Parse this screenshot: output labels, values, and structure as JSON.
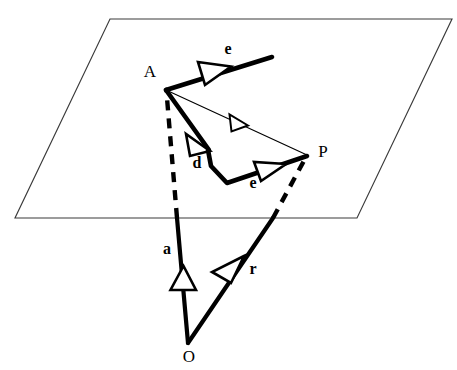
{
  "figure": {
    "background_color": "#ffffff",
    "stroke_color": "#000000",
    "plane_stroke_color": "#3a3a3a",
    "width": 457,
    "height": 370
  },
  "plane": {
    "name": "plane",
    "shape": "parallelogram",
    "corners": [
      {
        "label": "top-left",
        "x": 110,
        "y": 19
      },
      {
        "label": "top-right",
        "x": 452,
        "y": 19
      },
      {
        "label": "bottom-right",
        "x": 357,
        "y": 218
      },
      {
        "label": "bottom-left",
        "x": 15,
        "y": 218
      }
    ]
  },
  "points": [
    {
      "id": "A",
      "label": "A",
      "x": 166,
      "y": 90,
      "label_x": 150,
      "label_y": 73
    },
    {
      "id": "P",
      "label": "P",
      "x": 307,
      "y": 155,
      "label_x": 323,
      "label_y": 153
    },
    {
      "id": "O",
      "label": "O",
      "x": 188,
      "y": 343,
      "label_x": 189,
      "label_y": 358
    }
  ],
  "vectors": [
    {
      "id": "e-upper",
      "label": "e",
      "style": "thick-solid",
      "from": {
        "x": 166,
        "y": 90
      },
      "to": {
        "x": 272,
        "y": 57
      },
      "arrow_at": {
        "x": 212,
        "y": 75
      },
      "label_x": 228,
      "label_y": 50
    },
    {
      "id": "d",
      "label": "d",
      "style": "thick-solid",
      "from": {
        "x": 166,
        "y": 90
      },
      "to": {
        "x": 208,
        "y": 148
      },
      "arrow_at": {
        "x": 199,
        "y": 136
      },
      "label_x": 197,
      "label_y": 164
    },
    {
      "id": "e-lower",
      "label": "e",
      "style": "thick-solid",
      "from": {
        "x": 208,
        "y": 148
      },
      "via": [
        {
          "x": 211,
          "y": 164
        },
        {
          "x": 227,
          "y": 183
        }
      ],
      "to": {
        "x": 307,
        "y": 155
      },
      "arrow_at": {
        "x": 270,
        "y": 168
      },
      "label_x": 253,
      "label_y": 184
    },
    {
      "id": "AP",
      "label": "",
      "style": "thin",
      "from": {
        "x": 166,
        "y": 90
      },
      "to": {
        "x": 307,
        "y": 155
      },
      "arrow_at": {
        "x": 240,
        "y": 124
      },
      "label_x": 0,
      "label_y": 0
    },
    {
      "id": "a",
      "label": "a",
      "style": "solid-dashed",
      "from": {
        "x": 188,
        "y": 343
      },
      "to": {
        "x": 166,
        "y": 90
      },
      "plane_crossing": {
        "x": 177,
        "y": 218
      },
      "arrow_at": {
        "x": 181,
        "y": 278
      },
      "label_x": 167,
      "label_y": 250
    },
    {
      "id": "r",
      "label": "r",
      "style": "solid-dashed",
      "from": {
        "x": 188,
        "y": 343
      },
      "to": {
        "x": 307,
        "y": 155
      },
      "plane_crossing": {
        "x": 273,
        "y": 218
      },
      "arrow_at": {
        "x": 236,
        "y": 268
      },
      "label_x": 253,
      "label_y": 270
    }
  ],
  "labels": {
    "point_A": "A",
    "point_P": "P",
    "point_O": "O",
    "vec_e_upper": "e",
    "vec_e_lower": "e",
    "vec_d": "d",
    "vec_a": "a",
    "vec_r": "r"
  }
}
